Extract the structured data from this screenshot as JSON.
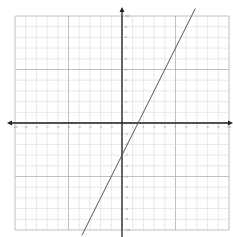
{
  "chart_data": {
    "type": "line",
    "title": "",
    "xlabel": "",
    "ylabel": "",
    "xlim": [
      -10,
      10
    ],
    "ylim": [
      -10,
      10
    ],
    "grid": true,
    "major_every": 5,
    "x_tick_labels": [
      "-10",
      "-9",
      "-8",
      "-7",
      "-6",
      "-5",
      "-4",
      "-3",
      "-2",
      "-1",
      "1",
      "2",
      "3",
      "4",
      "5",
      "6",
      "7",
      "8",
      "9",
      "10"
    ],
    "y_tick_labels": [
      "10",
      "9",
      "8",
      "7",
      "6",
      "5",
      "4",
      "3",
      "2",
      "1",
      "-1",
      "-2",
      "-3",
      "-4",
      "-5",
      "-6",
      "-7",
      "-8",
      "-9",
      "-10"
    ],
    "series": [
      {
        "name": "y = 2x - 3",
        "slope": 2,
        "intercept": -3,
        "x": [
          -3.5,
          6.5
        ],
        "y": [
          -10,
          10
        ],
        "color": "#555555"
      }
    ]
  },
  "colors": {
    "grid_minor": "#d8d8d8",
    "grid_major": "#b0b0b0",
    "axis": "#222222",
    "line": "#555555"
  }
}
